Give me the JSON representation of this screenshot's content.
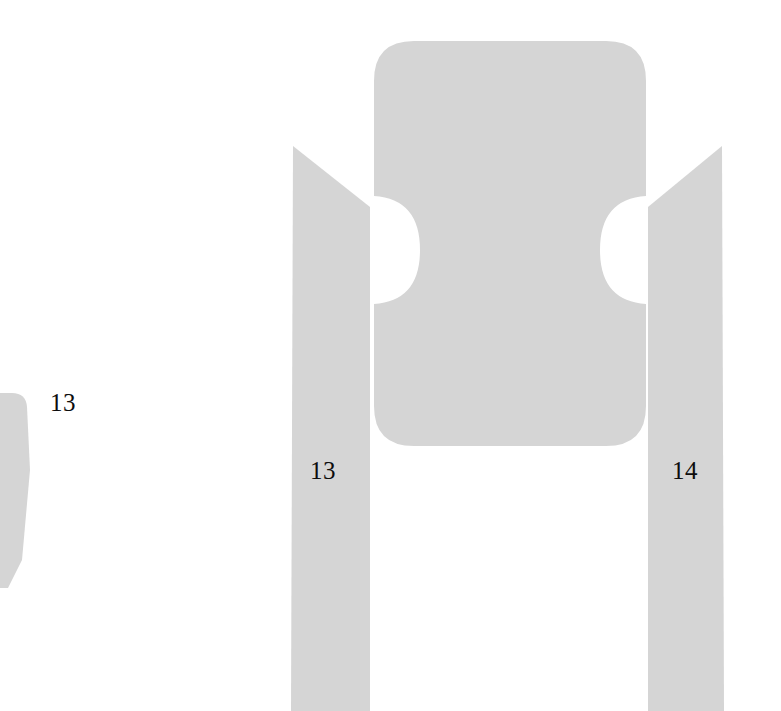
{
  "figure": {
    "background_color": "#ffffff",
    "shape_fill_color": "#d5d5d5",
    "label_color": "#0d0d0d",
    "width": 781,
    "height": 711
  },
  "labels": {
    "left_fragment": "13",
    "left_rail": "13",
    "right_rail": "14"
  },
  "shapes": [
    {
      "name": "left-partial-fragment",
      "numeral": "13",
      "description": "tapered strip clipped by the left page edge"
    },
    {
      "name": "left-rail",
      "numeral": "13",
      "description": "vertical rail with chamfered top-left corner running to the bottom edge"
    },
    {
      "name": "center-body",
      "numeral": "",
      "description": "rounded rectangular body with semicircular notches on both sides"
    },
    {
      "name": "right-rail",
      "numeral": "14",
      "description": "vertical rail with chamfered top-right corner running to the bottom edge"
    }
  ]
}
